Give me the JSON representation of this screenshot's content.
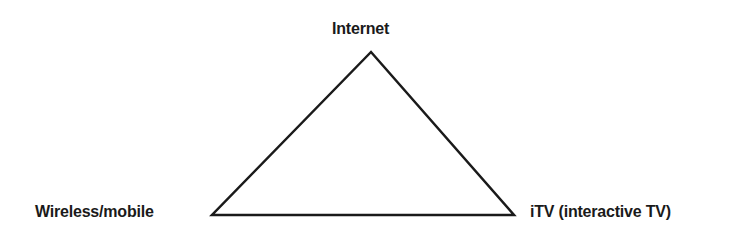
{
  "diagram": {
    "type": "triangle",
    "stroke_color": "#1a1a1a",
    "stroke_width": 2.5,
    "vertices": {
      "top": {
        "x": 371,
        "y": 52,
        "label": "Internet"
      },
      "bottom_left": {
        "x": 212,
        "y": 215,
        "label": "Wireless/mobile"
      },
      "bottom_right": {
        "x": 514,
        "y": 215,
        "label": "iTV (interactive TV)"
      }
    }
  },
  "labels": {
    "top": "Internet",
    "left": "Wireless/mobile",
    "right": "iTV (interactive TV)"
  }
}
